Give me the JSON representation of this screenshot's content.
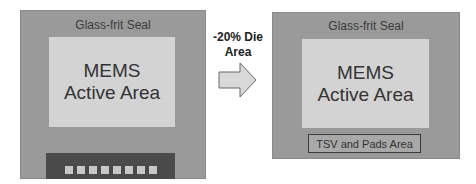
{
  "left_die": {
    "seal_label": "Glass-frit Seal",
    "active_line1": "MEMS",
    "active_line2": "Active Area",
    "pad_count": 8
  },
  "transition": {
    "line1": "-20% Die",
    "line2": "Area",
    "icon": "right-arrow-icon"
  },
  "right_die": {
    "seal_label": "Glass-frit Seal",
    "active_line1": "MEMS",
    "active_line2": "Active Area",
    "tsv_label": "TSV and Pads Area"
  },
  "colors": {
    "die": "#9a9a9a",
    "active": "#d3d3d3",
    "pad_bar": "#4a4a4a",
    "pad": "#c8c8c8"
  }
}
